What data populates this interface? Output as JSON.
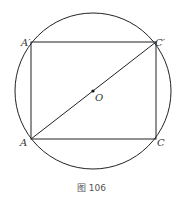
{
  "figure": {
    "caption": "图 106",
    "points": {
      "A_prime": "A′",
      "C_prime": "C′",
      "A": "A",
      "C": "C",
      "O": "O"
    },
    "shapes": {
      "circle": {
        "cx": 93,
        "cy": 90,
        "r": 78
      },
      "rectangle": {
        "x1": 31,
        "y1": 42,
        "x2": 156,
        "y2": 139
      },
      "diagonal": "A to C′",
      "center": "O"
    },
    "colors": {
      "stroke": "#222222",
      "text": "#333333"
    }
  }
}
